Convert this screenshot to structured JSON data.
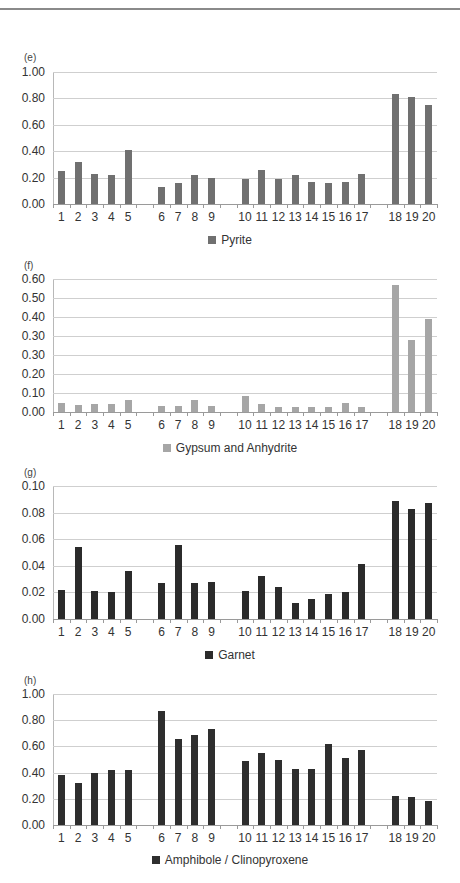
{
  "colors": {
    "pyrite": "#707070",
    "gypsum": "#a6a6a6",
    "garnet": "#2b2b2b",
    "amphibole": "#2e2e2e"
  },
  "chart_data": [
    {
      "type": "bar",
      "panel": "(e)",
      "legend": "Pyrite",
      "categories": [
        "1",
        "2",
        "3",
        "4",
        "5",
        "6",
        "7",
        "8",
        "9",
        "10",
        "11",
        "12",
        "13",
        "14",
        "15",
        "16",
        "17",
        "18",
        "19",
        "20"
      ],
      "groups": [
        [
          1,
          2,
          3,
          4,
          5
        ],
        [
          6,
          7,
          8,
          9
        ],
        [
          10,
          11,
          12,
          13,
          14,
          15,
          16,
          17
        ],
        [
          18,
          19,
          20
        ]
      ],
      "values": [
        0.25,
        0.32,
        0.23,
        0.22,
        0.41,
        0.13,
        0.16,
        0.22,
        0.2,
        0.19,
        0.26,
        0.19,
        0.22,
        0.17,
        0.16,
        0.17,
        0.23,
        0.83,
        0.81,
        0.75
      ],
      "ytick_labels": [
        "1.00",
        "0.80",
        "0.60",
        "0.40",
        "0.20",
        "0.00"
      ],
      "ylim": [
        0,
        1.0
      ],
      "grid": true,
      "legend_position": "bottom"
    },
    {
      "type": "bar",
      "panel": "(f)",
      "legend": "Gypsum and Anhydrite",
      "categories": [
        "1",
        "2",
        "3",
        "4",
        "5",
        "6",
        "7",
        "8",
        "9",
        "10",
        "11",
        "12",
        "13",
        "14",
        "15",
        "16",
        "17",
        "18",
        "19",
        "20"
      ],
      "groups": [
        [
          1,
          2,
          3,
          4,
          5
        ],
        [
          6,
          7,
          8,
          9
        ],
        [
          10,
          11,
          12,
          13,
          14,
          15,
          16,
          17
        ],
        [
          18,
          19,
          20
        ]
      ],
      "values": [
        0.046,
        0.037,
        0.04,
        0.04,
        0.061,
        0.033,
        0.03,
        0.065,
        0.032,
        0.084,
        0.04,
        0.028,
        0.028,
        0.025,
        0.028,
        0.047,
        0.028,
        0.667,
        0.379,
        0.488
      ],
      "ytick_labels": [
        "0.60",
        "0.50",
        "0.40",
        "0.30",
        "0.30",
        "0.20",
        "0.10",
        "0.00"
      ],
      "ylim": [
        0,
        0.7
      ],
      "note": "tick labels as printed (0.30 appears twice); values read on evenly spaced gridlines",
      "grid": true,
      "legend_position": "bottom"
    },
    {
      "type": "bar",
      "panel": "(g)",
      "legend": "Garnet",
      "categories": [
        "1",
        "2",
        "3",
        "4",
        "5",
        "6",
        "7",
        "8",
        "9",
        "10",
        "11",
        "12",
        "13",
        "14",
        "15",
        "16",
        "17",
        "18",
        "19",
        "20"
      ],
      "groups": [
        [
          1,
          2,
          3,
          4,
          5
        ],
        [
          6,
          7,
          8,
          9
        ],
        [
          10,
          11,
          12,
          13,
          14,
          15,
          16,
          17
        ],
        [
          18,
          19,
          20
        ]
      ],
      "values": [
        0.022,
        0.054,
        0.021,
        0.02,
        0.036,
        0.027,
        0.056,
        0.027,
        0.028,
        0.021,
        0.032,
        0.024,
        0.012,
        0.015,
        0.019,
        0.02,
        0.041,
        0.089,
        0.083,
        0.087
      ],
      "ytick_labels": [
        "0.10",
        "0.08",
        "0.06",
        "0.04",
        "0.02",
        "0.00"
      ],
      "ylim": [
        0,
        0.1
      ],
      "grid": true,
      "legend_position": "bottom"
    },
    {
      "type": "bar",
      "panel": "(h)",
      "legend": "Amphibole / Clinopyroxene",
      "categories": [
        "1",
        "2",
        "3",
        "4",
        "5",
        "6",
        "7",
        "8",
        "9",
        "10",
        "11",
        "12",
        "13",
        "14",
        "15",
        "16",
        "17",
        "18",
        "19",
        "20"
      ],
      "groups": [
        [
          1,
          2,
          3,
          4,
          5
        ],
        [
          6,
          7,
          8,
          9
        ],
        [
          10,
          11,
          12,
          13,
          14,
          15,
          16,
          17
        ],
        [
          18,
          19,
          20
        ]
      ],
      "values": [
        0.38,
        0.32,
        0.4,
        0.42,
        0.42,
        0.87,
        0.66,
        0.69,
        0.73,
        0.49,
        0.55,
        0.5,
        0.43,
        0.43,
        0.62,
        0.51,
        0.57,
        0.22,
        0.21,
        0.18
      ],
      "ytick_labels": [
        "1.00",
        "0.80",
        "0.60",
        "0.40",
        "0.20",
        "0.00"
      ],
      "ylim": [
        0,
        1.0
      ],
      "grid": true,
      "legend_position": "bottom"
    }
  ]
}
